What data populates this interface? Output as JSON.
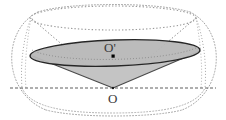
{
  "figure": {
    "type": "geometry-diagram",
    "canvas": {
      "width": 226,
      "height": 120,
      "background": "#ffffff"
    },
    "labels": {
      "apex": "O",
      "section_center": "O'"
    },
    "colors": {
      "section_fill": "#b9b9b9",
      "cone_fill": "#c9c9c9",
      "section_stroke": "#2b2b2b",
      "dotted_stroke": "#9a9a9a",
      "dashed_axis": "#6e6e6e",
      "label_color": "#3a3a3a",
      "point_marker": "#000000"
    },
    "geometry": {
      "apex_point": {
        "name": "O",
        "x": 113,
        "y": 88
      },
      "section_center_point": {
        "name": "O-prime",
        "x": 113,
        "y": 53
      },
      "top_rim_ellipse": {
        "cx": 113,
        "cy": 18,
        "rx": 83,
        "ry": 12,
        "style": "dotted"
      },
      "section_ellipse": {
        "cx": 115,
        "cy": 53,
        "rx": 85,
        "ry": 13,
        "style": "solid-filled",
        "rotation_deg": -2
      },
      "base_axis_line": {
        "x1": 12,
        "y1": 88,
        "x2": 214,
        "y2": 88,
        "style": "dashed"
      },
      "bottom_arc": {
        "cx": 113,
        "cy": 88,
        "rx": 92,
        "ry": 24,
        "style": "dotted"
      },
      "sphere_outline": {
        "cx": 113,
        "cy": 60,
        "rx": 101,
        "ry": 54,
        "style": "dotted-rounded"
      },
      "generatrices": [
        {
          "from": "apex",
          "to": "top-rim-left",
          "style": "dotted"
        },
        {
          "from": "apex",
          "to": "top-rim-right",
          "style": "dotted"
        },
        {
          "from": "apex",
          "to": "section-left",
          "style": "solid"
        },
        {
          "from": "apex",
          "to": "section-right",
          "style": "solid"
        }
      ]
    }
  }
}
